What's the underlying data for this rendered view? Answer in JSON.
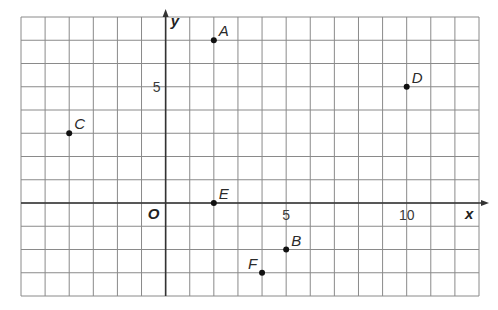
{
  "figure": {
    "title": "",
    "x_axis_label": "x",
    "y_axis_label": "y",
    "origin_label": "O",
    "x_range": [
      -6,
      13
    ],
    "y_range": [
      -4,
      8
    ],
    "grid": true,
    "x_tick_labels": [
      {
        "value": 5,
        "label": "5"
      },
      {
        "value": 10,
        "label": "10"
      }
    ],
    "y_tick_labels": [
      {
        "value": 5,
        "label": "5"
      }
    ],
    "colors": {
      "grid": "#8a8a8a",
      "axis": "#333333",
      "point": "#111111",
      "background": "#ffffff"
    }
  },
  "points": [
    {
      "label": "A",
      "x": 2,
      "y": 7
    },
    {
      "label": "B",
      "x": 5,
      "y": -2
    },
    {
      "label": "C",
      "x": -4,
      "y": 3
    },
    {
      "label": "D",
      "x": 10,
      "y": 5
    },
    {
      "label": "E",
      "x": 2,
      "y": 0
    },
    {
      "label": "F",
      "x": 4,
      "y": -3
    }
  ],
  "chart_data": {
    "type": "scatter",
    "title": "",
    "xlabel": "x",
    "ylabel": "y",
    "xlim": [
      -6,
      13
    ],
    "ylim": [
      -4,
      8
    ],
    "grid": true,
    "x_ticks_labeled": [
      5,
      10
    ],
    "y_ticks_labeled": [
      5
    ],
    "series": [
      {
        "name": "points",
        "labels": [
          "A",
          "B",
          "C",
          "D",
          "E",
          "F"
        ],
        "x": [
          2,
          5,
          -4,
          10,
          2,
          4
        ],
        "y": [
          7,
          -2,
          3,
          5,
          0,
          -3
        ]
      }
    ],
    "annotations": [
      "O (origin)"
    ]
  }
}
